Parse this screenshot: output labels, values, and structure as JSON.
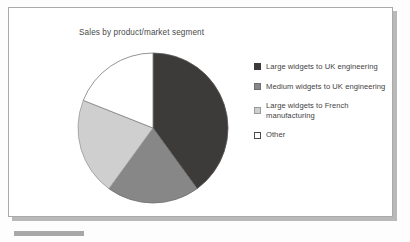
{
  "chart_data": {
    "type": "pie",
    "title": "Sales by product/market segment",
    "xlabel": "",
    "ylabel": "",
    "grid": false,
    "legend_position": "right",
    "categories": [
      "Large widgets to UK engineering",
      "Medium widgets to UK engineering",
      "Large widgets to French manufacturing",
      "Other"
    ],
    "values": [
      40,
      20,
      21,
      19
    ],
    "colors": [
      "#3d3a3a",
      "#878787",
      "#cfcfcf",
      "#ffffff"
    ],
    "start_angle_deg": 0,
    "direction": "clockwise"
  },
  "chart": {
    "title": "Sales by product/market segment"
  },
  "legend": {
    "items": [
      {
        "label": "Large widgets to UK engineering",
        "swatch_name": "legend-swatch-large-widgets-uk",
        "color": "#3d3a3a",
        "value": 40
      },
      {
        "label": "Medium widgets to UK engineering",
        "swatch_name": "legend-swatch-medium-widgets-uk",
        "color": "#878787",
        "value": 20
      },
      {
        "label": "Large widgets to French manufacturing",
        "swatch_name": "legend-swatch-large-widgets-french",
        "color": "#cfcfcf",
        "value": 21
      },
      {
        "label": "Other",
        "swatch_name": "legend-swatch-other",
        "color": "#ffffff",
        "value": 19
      }
    ]
  },
  "style": {
    "frame_border": "#a9a9a9",
    "shadow": "#b9b9b9",
    "title_color": "#4a4a4a",
    "pie_outline": "#6a6a6a"
  }
}
